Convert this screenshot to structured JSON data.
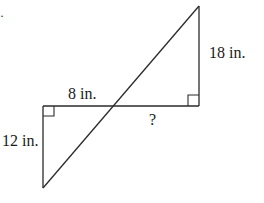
{
  "diagram": {
    "type": "geometry-similar-triangles",
    "stroke_color": "#2a2a2a",
    "labels": {
      "top_vertical": "18 in.",
      "left_horizontal": "8 in.",
      "right_horizontal": "?",
      "left_vertical": "12 in."
    },
    "right_angle_markers": 2,
    "artifact": "·"
  }
}
